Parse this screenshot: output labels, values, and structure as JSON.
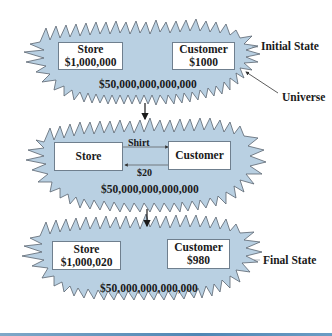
{
  "colors": {
    "cloud_fill": "#b9d0e2",
    "cloud_stroke": "#5a6470",
    "box_fill": "#ffffff",
    "text": "#1a1a1a",
    "bottom_bar": "#4f86b4"
  },
  "diagram": {
    "states": [
      {
        "name": "Initial State",
        "store": {
          "label": "Store",
          "amount": "$1,000,000"
        },
        "customer": {
          "label": "Customer",
          "amount": "$1000"
        },
        "universe_total": "$50,000,000,000,000",
        "side_label": "Initial State",
        "pointer_label": "Universe"
      },
      {
        "name": "Transaction",
        "store": {
          "label": "Store"
        },
        "customer": {
          "label": "Customer"
        },
        "flows": [
          {
            "label": "Shirt",
            "from": "Store",
            "to": "Customer"
          },
          {
            "label": "$20",
            "from": "Customer",
            "to": "Store"
          }
        ],
        "universe_total": "$50,000,000,000,000"
      },
      {
        "name": "Final State",
        "store": {
          "label": "Store",
          "amount": "$1,000,020"
        },
        "customer": {
          "label": "Customer",
          "amount": "$980"
        },
        "universe_total": "$50,000,000,000,000",
        "side_label": "Final State"
      }
    ]
  }
}
